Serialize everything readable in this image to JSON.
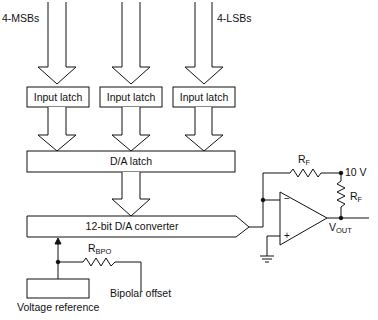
{
  "diagram": {
    "inputs": {
      "msb_label": "4-MSBs",
      "lsb_label": "4-LSBs"
    },
    "input_latches": [
      {
        "label": "Input latch"
      },
      {
        "label": "Input latch"
      },
      {
        "label": "Input latch"
      }
    ],
    "da_latch": {
      "label": "D/A latch"
    },
    "converter": {
      "label": "12-bit D/A converter"
    },
    "voltage_reference": {
      "label": "Voltage reference"
    },
    "bipolar_offset": {
      "resistor_label": "R",
      "resistor_sub": "BPO",
      "label": "Bipolar offset"
    },
    "opamp": {
      "minus": "−",
      "plus": "+"
    },
    "feedback_resistor_top": {
      "label": "R",
      "sub": "F"
    },
    "feedback_resistor_side": {
      "label": "R",
      "sub": "F"
    },
    "supply_label": "10 V",
    "output": {
      "label": "V",
      "sub": "OUT"
    },
    "colors": {
      "line": "#111111",
      "background": "#ffffff"
    }
  }
}
